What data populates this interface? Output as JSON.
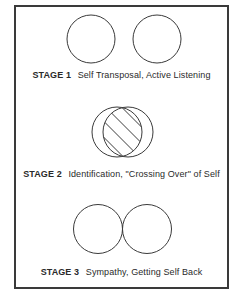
{
  "stages": [
    {
      "label": "STAGE 1",
      "description": "Self Transposal, Active Listening",
      "circle_relation": "separate"
    },
    {
      "label": "STAGE 2",
      "description": "Identification, \"Crossing Over\" of Self",
      "circle_relation": "overlapping-hatched"
    },
    {
      "label": "STAGE 3",
      "description": "Sympathy, Getting Self Back",
      "circle_relation": "touching"
    }
  ],
  "colors": {
    "stroke": "#3a3a3a",
    "background": "#ffffff",
    "text": "#2a2a2a"
  }
}
